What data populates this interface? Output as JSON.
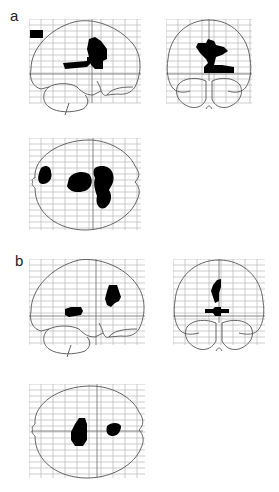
{
  "figure": {
    "panels": [
      {
        "label": "a",
        "views": [
          "sagittal",
          "coronal",
          "axial"
        ]
      },
      {
        "label": "b",
        "views": [
          "sagittal",
          "coronal",
          "axial"
        ]
      }
    ]
  },
  "colors": {
    "grid": "#b8b8b8",
    "outline": "#555555",
    "activation": "#000000",
    "background": "#ffffff"
  }
}
